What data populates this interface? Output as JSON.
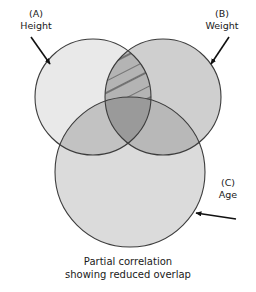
{
  "figure": {
    "background_color": "#ffffff",
    "stroke_color": "#3c3c3c"
  },
  "circles": [
    {
      "key": "A",
      "tag": "(A)",
      "name": "Height",
      "fill": "#e9e9e9",
      "cx": 93,
      "cy": 97,
      "r": 58
    },
    {
      "key": "B",
      "tag": "(B)",
      "name": "Weight",
      "fill": "#cfcfcf",
      "cx": 163,
      "cy": 97,
      "r": 58
    },
    {
      "key": "C",
      "tag": "(C)",
      "name": "Age",
      "fill": "#dbdbdb",
      "cx": 130,
      "cy": 172,
      "r": 75
    }
  ],
  "regions": {
    "ab_overlap_fill": "#b4b4b4",
    "ac_overlap_fill": "#c2c2c2",
    "bc_overlap_fill": "#b8b8b8",
    "abc_overlap_fill": "#9a9a9a",
    "hatch_color": "#3c3c3c",
    "hatch_spacing": 11,
    "hatch_angle_deg": 27
  },
  "labels": [
    {
      "id": "label-a",
      "tag": "(A)",
      "name": "Height",
      "x": 36,
      "y": 17,
      "arrow": {
        "x1": 31,
        "y1": 37,
        "x2": 50,
        "y2": 64
      }
    },
    {
      "id": "label-b",
      "tag": "(B)",
      "name": "Weight",
      "x": 222,
      "y": 17,
      "arrow": {
        "x1": 229,
        "y1": 37,
        "x2": 211,
        "y2": 64
      }
    },
    {
      "id": "label-c",
      "tag": "(C)",
      "name": "Age",
      "x": 228,
      "y": 182,
      "arrow": {
        "x1": 236,
        "y1": 219,
        "x2": 196,
        "y2": 213
      }
    }
  ],
  "caption": {
    "line1": "Partial correlation",
    "line2": "showing reduced overlap"
  }
}
